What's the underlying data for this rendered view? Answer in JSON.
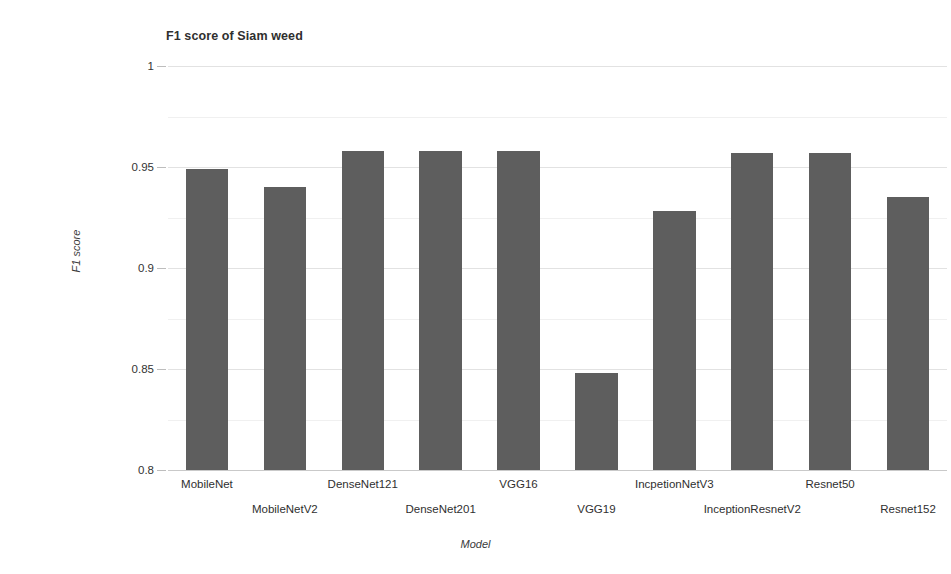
{
  "chart_data": {
    "type": "bar",
    "title": "F1 score of Siam weed",
    "xlabel": "Model",
    "ylabel": "F1 score",
    "ylim": [
      0.8,
      1
    ],
    "yticks": [
      "0.8",
      "0.85",
      "0.9",
      "0.95",
      "1"
    ],
    "ytick_values": [
      0.8,
      0.85,
      0.9,
      0.95,
      1
    ],
    "minor_gridlines": [
      0.825,
      0.875,
      0.925,
      0.975
    ],
    "grid": true,
    "legend": "none",
    "bar_color": "#5e5e5e",
    "categories": [
      "MobileNet",
      "MobileNetV2",
      "DenseNet121",
      "DenseNet201",
      "VGG16",
      "VGG19",
      "IncpetionNetV3",
      "InceptionResnetV2",
      "Resnet50",
      "Resnet152"
    ],
    "values": [
      0.949,
      0.94,
      0.958,
      0.958,
      0.958,
      0.848,
      0.928,
      0.957,
      0.957,
      0.935
    ]
  }
}
